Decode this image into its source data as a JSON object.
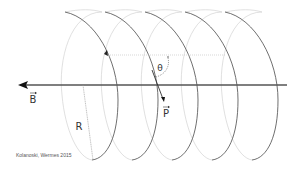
{
  "diagram": {
    "type": "helix-trajectory",
    "labels": {
      "field": "B",
      "momentum": "P",
      "radius": "R",
      "pitch_angle": "θ"
    },
    "credit": "Kolanoski, Wermes 2015",
    "colors": {
      "axis": "#555555",
      "front_arc": "#4a4a4a",
      "back_arc": "#cfcfcf",
      "dotted": "#bdbdbd",
      "text": "#333333"
    },
    "loops": 5
  }
}
